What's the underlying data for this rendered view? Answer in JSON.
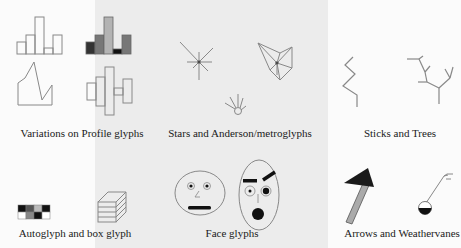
{
  "figure": {
    "sections": [
      {
        "id": "profile",
        "caption": "Variations on Profile glyphs"
      },
      {
        "id": "stars",
        "caption": "Stars and Anderson/metroglyphs"
      },
      {
        "id": "sticks",
        "caption": "Sticks and Trees"
      },
      {
        "id": "autoglyph",
        "caption": "Autoglyph and box glyph"
      },
      {
        "id": "faces",
        "caption": "Face glyphs"
      },
      {
        "id": "arrows",
        "caption": "Arrows and Weathervanes"
      }
    ],
    "colors": {
      "background": "#fbfbfb",
      "panel": "#ececec",
      "stroke": "#8a8a8a",
      "dark": "#1a1a1a",
      "mid_gray": "#777777",
      "light_gray": "#b0b0b0"
    }
  }
}
